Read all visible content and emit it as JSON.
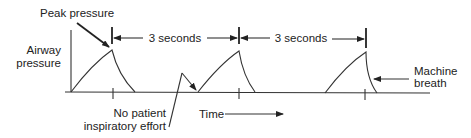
{
  "diagram": {
    "type": "ventilator-pressure-waveform",
    "labels": {
      "peak_pressure": "Peak pressure",
      "y_axis_line1": "Airway",
      "y_axis_line2": "pressure",
      "interval_1": "3 seconds",
      "interval_2": "3 seconds",
      "machine_breath_line1": "Machine",
      "machine_breath_line2": "breath",
      "no_effort_line1": "No patient",
      "no_effort_line2": "inspiratory effort",
      "x_axis": "Time"
    },
    "breaths": [
      {
        "name": "breath-1",
        "type": "machine"
      },
      {
        "name": "breath-2",
        "type": "machine"
      },
      {
        "name": "breath-3",
        "type": "machine"
      }
    ],
    "interval_seconds": 3,
    "colors": {
      "line": "#333333",
      "text": "#222222",
      "background": "#ffffff"
    }
  }
}
